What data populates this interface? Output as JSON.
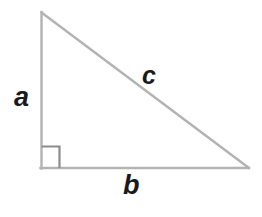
{
  "figure": {
    "type": "right-triangle-diagram",
    "background_color": "#ffffff",
    "width": 262,
    "height": 217
  },
  "geometry": {
    "vertices": {
      "apex": {
        "x": 41,
        "y": 12
      },
      "right_angle": {
        "x": 41,
        "y": 168
      },
      "base_right": {
        "x": 249,
        "y": 168
      }
    },
    "sides": {
      "vertical_leg": {
        "label": "a",
        "from": "apex",
        "to": "right_angle"
      },
      "horizontal_leg": {
        "label": "b",
        "from": "right_angle",
        "to": "base_right"
      },
      "hypotenuse": {
        "label": "c",
        "from": "apex",
        "to": "base_right"
      }
    },
    "right_angle_marker": {
      "x": 41,
      "y": 145,
      "size": 18
    }
  },
  "colors": {
    "triangle_stroke": "#b3b3b3",
    "right_angle_stroke": "#8c8c8c",
    "label_color": "#1a1a1a",
    "background": "#ffffff"
  },
  "labels": {
    "leg_a": "a",
    "leg_b": "b",
    "hypotenuse_c": "c"
  }
}
